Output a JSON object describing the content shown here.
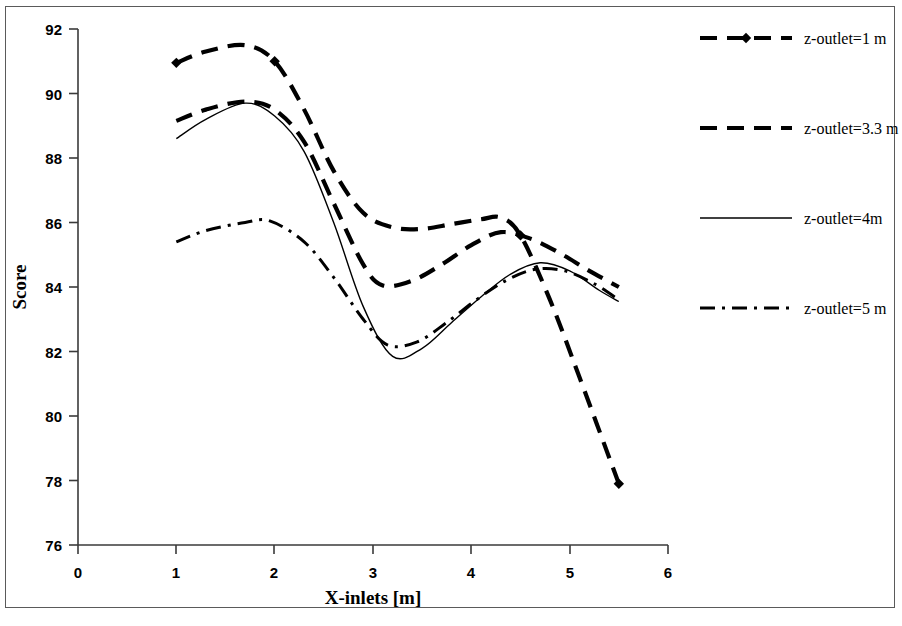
{
  "chart_data": {
    "type": "line",
    "title": "",
    "xlabel": "X-inlets [m]",
    "ylabel": "Score",
    "xlim": [
      0,
      6
    ],
    "ylim": [
      76,
      92
    ],
    "xticks": [
      "0",
      "1",
      "2",
      "3",
      "4",
      "5",
      "6"
    ],
    "yticks": [
      "76",
      "78",
      "80",
      "82",
      "84",
      "86",
      "88",
      "90",
      "92"
    ],
    "grid": false,
    "legend_position": "right",
    "series": [
      {
        "name": "z-outlet=1 m",
        "style": "thick-dashed-with-diamond-markers",
        "color": "#000000",
        "x": [
          1.0,
          1.3,
          1.7,
          2.0,
          2.3,
          2.6,
          2.9,
          3.2,
          3.5,
          3.8,
          4.1,
          4.3,
          4.5,
          4.8,
          5.1,
          5.5
        ],
        "y": [
          90.95,
          91.3,
          91.5,
          91.0,
          89.5,
          87.6,
          86.3,
          85.85,
          85.8,
          85.95,
          86.1,
          86.15,
          85.6,
          83.6,
          81.2,
          77.9
        ],
        "markers_x": [
          1.0,
          2.0,
          4.5,
          5.5
        ],
        "markers_y": [
          90.95,
          91.0,
          85.6,
          77.9
        ]
      },
      {
        "name": "z-outlet=3.3 m",
        "style": "thick-dashed",
        "color": "#000000",
        "x": [
          1.0,
          1.3,
          1.7,
          2.0,
          2.3,
          2.6,
          2.9,
          3.1,
          3.4,
          3.7,
          4.0,
          4.3,
          4.6,
          4.9,
          5.2,
          5.5
        ],
        "y": [
          89.15,
          89.5,
          89.75,
          89.5,
          88.5,
          86.6,
          84.7,
          84.05,
          84.2,
          84.7,
          85.3,
          85.7,
          85.5,
          85.05,
          84.5,
          84.0
        ]
      },
      {
        "name": "z-outlet=4m",
        "style": "thin-solid",
        "color": "#000000",
        "x": [
          1.0,
          1.3,
          1.7,
          2.0,
          2.3,
          2.6,
          2.9,
          3.2,
          3.5,
          3.8,
          4.1,
          4.4,
          4.7,
          5.0,
          5.3,
          5.5
        ],
        "y": [
          88.6,
          89.2,
          89.7,
          89.3,
          88.2,
          86.0,
          83.4,
          81.85,
          82.1,
          82.9,
          83.7,
          84.4,
          84.75,
          84.5,
          83.9,
          83.55
        ]
      },
      {
        "name": "z-outlet=5 m",
        "style": "dash-dot",
        "color": "#000000",
        "x": [
          1.0,
          1.3,
          1.7,
          1.95,
          2.3,
          2.6,
          2.9,
          3.15,
          3.45,
          3.75,
          4.05,
          4.35,
          4.65,
          4.95,
          5.25,
          5.5
        ],
        "y": [
          85.4,
          85.75,
          86.0,
          86.05,
          85.4,
          84.3,
          83.0,
          82.2,
          82.3,
          82.9,
          83.6,
          84.2,
          84.55,
          84.5,
          84.1,
          83.6
        ]
      }
    ]
  },
  "axes": {
    "y_title": "Score",
    "x_title": "X-inlets [m]",
    "x_tick_labels": [
      "0",
      "1",
      "2",
      "3",
      "4",
      "5",
      "6"
    ],
    "y_tick_labels": [
      "76",
      "78",
      "80",
      "82",
      "84",
      "86",
      "88",
      "90",
      "92"
    ]
  },
  "legend": {
    "entries": [
      {
        "label": "z-outlet=1 m",
        "style": "thick-dashed-with-diamond-markers"
      },
      {
        "label": "z-outlet=3.3 m",
        "style": "thick-dashed"
      },
      {
        "label": "z-outlet=4m",
        "style": "thin-solid"
      },
      {
        "label": "z-outlet=5 m",
        "style": "dash-dot"
      }
    ]
  }
}
